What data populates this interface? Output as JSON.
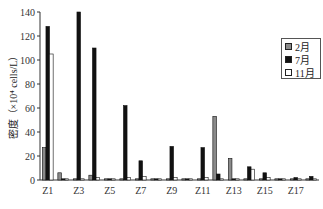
{
  "chart_data": {
    "type": "bar",
    "title": "",
    "xlabel": "",
    "ylabel": "密度（×10⁴ cells/L）",
    "ylim": [
      0,
      140
    ],
    "yticks": [
      0,
      20,
      40,
      60,
      80,
      100,
      120,
      140
    ],
    "categories": [
      "Z1",
      "Z2",
      "Z3",
      "Z4",
      "Z5",
      "Z6",
      "Z7",
      "Z8",
      "Z9",
      "Z10",
      "Z11",
      "Z12",
      "Z13",
      "Z14",
      "Z15",
      "Z16",
      "Z17",
      "Z18"
    ],
    "xtick_labels_shown": [
      "Z1",
      "Z3",
      "Z5",
      "Z7",
      "Z9",
      "Z11",
      "Z13",
      "Z15",
      "Z17"
    ],
    "grid": false,
    "legend_position": "upper right",
    "series": [
      {
        "name": "2月",
        "color": "#8a8a8a",
        "values": [
          27,
          6,
          1,
          4,
          1,
          1,
          1,
          1,
          1,
          1,
          1,
          53,
          18,
          1,
          1,
          1,
          1,
          1
        ]
      },
      {
        "name": "7月",
        "color": "#111111",
        "values": [
          128,
          1,
          140,
          110,
          1,
          62,
          16,
          1,
          28,
          1,
          27,
          5,
          1,
          11,
          6,
          1,
          2,
          3
        ]
      },
      {
        "name": "11月",
        "color": "#ffffff",
        "values": [
          105,
          1,
          1,
          2,
          1,
          2,
          3,
          1,
          2,
          1,
          2,
          1,
          1,
          9,
          2,
          1,
          1,
          1
        ]
      }
    ]
  },
  "legend": {
    "items": [
      {
        "label": "2月",
        "color": "#8a8a8a"
      },
      {
        "label": "7月",
        "color": "#111111"
      },
      {
        "label": "11月",
        "color": "#ffffff"
      }
    ]
  }
}
